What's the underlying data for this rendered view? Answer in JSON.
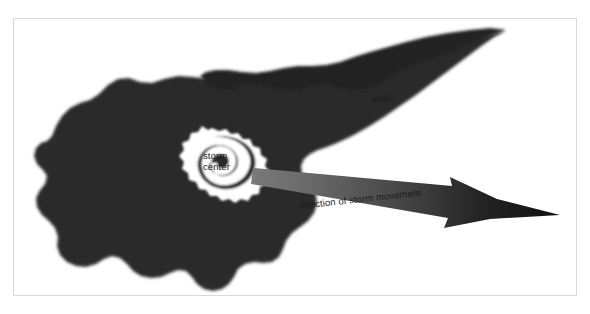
{
  "figure": {
    "name": "thunderstorm-anatomy-diagram",
    "background_color": "#ffffff",
    "frame_color": "#d9d9d9"
  },
  "colors": {
    "cloud_fill": "#2b2b2b",
    "anvil_fill": "#242424",
    "eye_fill": "#ffffff",
    "arrow_head": "#101010",
    "arrow_tail": "#6e6e6e",
    "label_text": "#1b1b1b"
  },
  "labels": {
    "anvil": "anvil",
    "storm_center_line1": "storm",
    "storm_center_line2": "center",
    "direction": "direction of storm movement"
  },
  "icons": {
    "cloud": "storm-cloud-shape",
    "anvil": "anvil-plume-shape",
    "eye": "storm-eye-spiral",
    "arrow": "direction-arrow"
  }
}
